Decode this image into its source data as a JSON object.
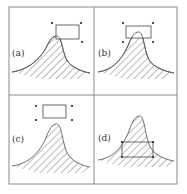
{
  "figure": {
    "frame": {
      "x": 9,
      "y": 7,
      "width": 168,
      "height": 177,
      "divider_x": 94,
      "divider_y": 95
    },
    "colors": {
      "line": "#5a5a5a",
      "frame": "#8a8a8a",
      "hatch": "#555555",
      "background": "#ffffff"
    },
    "panels": [
      {
        "id": "a",
        "label": "(a)",
        "label_pos": [
          12,
          56
        ],
        "curve": {
          "x0": 12,
          "x1": 90,
          "base_y": 72,
          "peak_x": 55,
          "peak_y": 36
        },
        "rect": {
          "x": 56,
          "y": 25,
          "w": 23,
          "h": 14
        },
        "dots": [
          [
            52,
            23
          ],
          [
            81,
            23
          ],
          [
            82,
            42
          ]
        ]
      },
      {
        "id": "b",
        "label": "(b)",
        "label_pos": [
          98,
          56
        ],
        "curve": {
          "x0": 98,
          "x1": 174,
          "base_y": 72,
          "peak_x": 137,
          "peak_y": 32
        },
        "rect": {
          "x": 126,
          "y": 26,
          "w": 25,
          "h": 12
        },
        "dots": [
          [
            123,
            23
          ],
          [
            153,
            23
          ],
          [
            123,
            42
          ],
          [
            153,
            42
          ]
        ]
      },
      {
        "id": "c",
        "label": "(c)",
        "label_pos": [
          12,
          142
        ],
        "curve": {
          "x0": 12,
          "x1": 90,
          "base_y": 166,
          "peak_x": 55,
          "peak_y": 124
        },
        "rect": {
          "x": 43,
          "y": 105,
          "w": 23,
          "h": 13
        },
        "dots": [
          [
            36,
            106
          ],
          [
            72,
            106
          ],
          [
            36,
            120
          ],
          [
            72,
            120
          ]
        ]
      },
      {
        "id": "d",
        "label": "(d)",
        "label_pos": [
          98,
          141
        ],
        "curve": {
          "x0": 98,
          "x1": 174,
          "base_y": 160,
          "peak_x": 138,
          "peak_y": 116
        },
        "rect": {
          "x": 122,
          "y": 142,
          "w": 31,
          "h": 15
        },
        "dots": [
          [
            122,
            142
          ],
          [
            153,
            142
          ],
          [
            122,
            157
          ],
          [
            153,
            157
          ]
        ]
      }
    ]
  }
}
